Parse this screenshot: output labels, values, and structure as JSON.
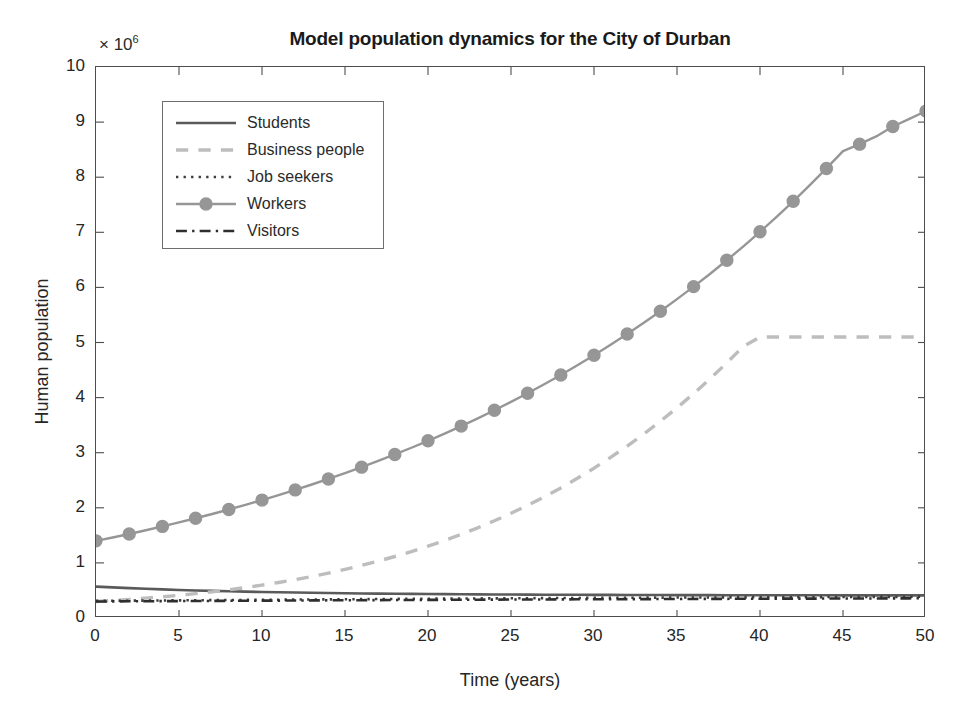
{
  "chart_data": {
    "type": "line",
    "title": "Model population dynamics for the City of Durban",
    "xlabel": "Time (years)",
    "ylabel": "Human population",
    "y_exponent_prefix": "× 10",
    "y_exponent_power": "6",
    "y_scale_factor": 1000000,
    "xlim": [
      0,
      50
    ],
    "ylim": [
      0,
      10
    ],
    "xticks": [
      0,
      5,
      10,
      15,
      20,
      25,
      30,
      35,
      40,
      45,
      50
    ],
    "yticks": [
      0,
      1,
      2,
      3,
      4,
      5,
      6,
      7,
      8,
      9,
      10
    ],
    "grid": false,
    "legend_position": "upper-left-inside",
    "x": [
      0,
      1,
      2,
      3,
      4,
      5,
      6,
      7,
      8,
      9,
      10,
      11,
      12,
      13,
      14,
      15,
      16,
      17,
      18,
      19,
      20,
      21,
      22,
      23,
      24,
      25,
      26,
      27,
      28,
      29,
      30,
      31,
      32,
      33,
      34,
      35,
      36,
      37,
      38,
      39,
      40,
      41,
      42,
      43,
      44,
      45,
      46,
      47,
      48,
      49,
      50
    ],
    "series": [
      {
        "name": "Students",
        "color": "#5a5a5a",
        "linestyle": "solid",
        "marker": "none",
        "values": [
          0.57,
          0.555,
          0.542,
          0.53,
          0.519,
          0.509,
          0.5,
          0.492,
          0.485,
          0.478,
          0.472,
          0.467,
          0.462,
          0.457,
          0.453,
          0.449,
          0.446,
          0.443,
          0.44,
          0.437,
          0.435,
          0.433,
          0.431,
          0.429,
          0.427,
          0.426,
          0.424,
          0.423,
          0.422,
          0.421,
          0.42,
          0.419,
          0.418,
          0.417,
          0.417,
          0.416,
          0.415,
          0.415,
          0.414,
          0.414,
          0.413,
          0.413,
          0.412,
          0.412,
          0.412,
          0.411,
          0.411,
          0.411,
          0.41,
          0.41,
          0.41
        ]
      },
      {
        "name": "Business people",
        "color": "#bdbdbd",
        "linestyle": "dashed",
        "marker": "none",
        "values": [
          0.3,
          0.318,
          0.338,
          0.36,
          0.385,
          0.412,
          0.442,
          0.475,
          0.512,
          0.552,
          0.596,
          0.644,
          0.696,
          0.753,
          0.815,
          0.882,
          0.954,
          1.032,
          1.116,
          1.206,
          1.303,
          1.407,
          1.518,
          1.637,
          1.764,
          1.9,
          2.044,
          2.198,
          2.361,
          2.535,
          2.719,
          2.914,
          3.121,
          3.34,
          3.571,
          3.815,
          4.073,
          4.344,
          4.63,
          4.931,
          5.1,
          5.1,
          5.1,
          5.1,
          5.1,
          5.1,
          5.1,
          5.1,
          5.1,
          5.1,
          5.1
        ]
      },
      {
        "name": "Job seekers",
        "color": "#3d3d3d",
        "linestyle": "dotted",
        "marker": "none",
        "values": [
          0.31,
          0.312,
          0.314,
          0.316,
          0.318,
          0.32,
          0.322,
          0.324,
          0.326,
          0.328,
          0.33,
          0.332,
          0.334,
          0.336,
          0.338,
          0.34,
          0.342,
          0.344,
          0.346,
          0.348,
          0.35,
          0.352,
          0.353,
          0.355,
          0.356,
          0.358,
          0.359,
          0.361,
          0.362,
          0.364,
          0.365,
          0.366,
          0.367,
          0.369,
          0.37,
          0.371,
          0.372,
          0.373,
          0.374,
          0.375,
          0.376,
          0.377,
          0.378,
          0.379,
          0.38,
          0.381,
          0.382,
          0.383,
          0.384,
          0.385,
          0.386
        ]
      },
      {
        "name": "Workers",
        "color": "#969696",
        "linestyle": "solid",
        "marker": "circle",
        "values": [
          1.4,
          1.46,
          1.525,
          1.592,
          1.662,
          1.735,
          1.81,
          1.888,
          1.969,
          2.053,
          2.14,
          2.231,
          2.325,
          2.423,
          2.524,
          2.629,
          2.738,
          2.851,
          2.968,
          3.09,
          3.216,
          3.347,
          3.483,
          3.624,
          3.77,
          3.922,
          4.079,
          4.242,
          4.411,
          4.587,
          4.769,
          4.958,
          5.154,
          5.357,
          5.568,
          5.787,
          6.014,
          6.249,
          6.493,
          6.746,
          7.009,
          7.281,
          7.563,
          7.856,
          8.159,
          8.474,
          8.6,
          8.74,
          8.92,
          9.06,
          9.2
        ]
      },
      {
        "name": "Visitors",
        "color": "#2e2e2e",
        "linestyle": "dashdot",
        "marker": "none",
        "values": [
          0.3,
          0.301,
          0.303,
          0.304,
          0.306,
          0.307,
          0.309,
          0.31,
          0.312,
          0.313,
          0.315,
          0.316,
          0.318,
          0.319,
          0.321,
          0.322,
          0.323,
          0.325,
          0.326,
          0.327,
          0.329,
          0.33,
          0.331,
          0.332,
          0.334,
          0.335,
          0.336,
          0.337,
          0.338,
          0.339,
          0.34,
          0.341,
          0.342,
          0.343,
          0.344,
          0.345,
          0.346,
          0.347,
          0.348,
          0.349,
          0.35,
          0.351,
          0.352,
          0.352,
          0.353,
          0.354,
          0.355,
          0.355,
          0.356,
          0.357,
          0.358
        ]
      }
    ]
  }
}
